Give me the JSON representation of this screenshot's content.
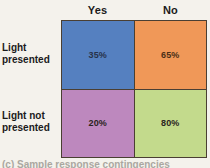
{
  "figure": {
    "background_color": "#f4f2ec",
    "border_color": "#4a3f33",
    "caption": "(c) Sample response contingencies"
  },
  "chart_data": {
    "type": "table",
    "title": "",
    "xlabel": "",
    "ylabel": "",
    "grid": true,
    "legend_position": "none",
    "column_headers": [
      "Yes",
      "No"
    ],
    "row_headers": [
      {
        "line1": "Light",
        "line2": "presented"
      },
      {
        "line1": "Light not",
        "line2": "presented"
      }
    ],
    "cells": [
      {
        "row": "Light presented",
        "column": "Yes",
        "value": 35,
        "label": "35%",
        "color": "#5580c0",
        "text_color": "#27324a"
      },
      {
        "row": "Light presented",
        "column": "No",
        "value": 65,
        "label": "65%",
        "color": "#f09858",
        "text_color": "#4a2f16"
      },
      {
        "row": "Light not presented",
        "column": "Yes",
        "value": 20,
        "label": "20%",
        "color": "#bd88be",
        "text_color": "#2a2520"
      },
      {
        "row": "Light not presented",
        "column": "No",
        "value": 80,
        "label": "80%",
        "color": "#c3da8c",
        "text_color": "#2a2520"
      }
    ]
  }
}
